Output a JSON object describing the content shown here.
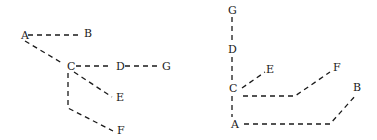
{
  "diagrams": [
    {
      "name": "left-tree",
      "nodes": [
        {
          "id": "A",
          "label": "A",
          "x": 21,
          "y": 39
        },
        {
          "id": "B",
          "label": "B",
          "x": 84,
          "y": 37
        },
        {
          "id": "C",
          "label": "C",
          "x": 67,
          "y": 70
        },
        {
          "id": "D",
          "label": "D",
          "x": 116,
          "y": 70
        },
        {
          "id": "G",
          "label": "G",
          "x": 162,
          "y": 70
        },
        {
          "id": "E",
          "label": "E",
          "x": 116,
          "y": 101
        },
        {
          "id": "F",
          "label": "F",
          "x": 117,
          "y": 134
        }
      ],
      "edges": [
        {
          "from": "A",
          "to": "B",
          "points": [
            [
              28,
              35
            ],
            [
              79,
              35
            ]
          ]
        },
        {
          "from": "A",
          "to": "C",
          "points": [
            [
              25,
              41
            ],
            [
              62,
              63
            ]
          ]
        },
        {
          "from": "C",
          "to": "D",
          "points": [
            [
              76,
              66
            ],
            [
              111,
              66
            ]
          ]
        },
        {
          "from": "D",
          "to": "G",
          "points": [
            [
              125,
              66
            ],
            [
              157,
              66
            ]
          ]
        },
        {
          "from": "C",
          "to": "E",
          "points": [
            [
              74,
              72
            ],
            [
              112,
              97
            ]
          ]
        },
        {
          "from": "C",
          "to": "F",
          "points": [
            [
              68,
              73
            ],
            [
              68,
              108
            ],
            [
              113,
              131
            ]
          ]
        }
      ]
    },
    {
      "name": "right-tree",
      "nodes": [
        {
          "id": "G",
          "label": "G",
          "x": 228,
          "y": 14
        },
        {
          "id": "D",
          "label": "D",
          "x": 228,
          "y": 53
        },
        {
          "id": "C",
          "label": "C",
          "x": 229,
          "y": 92
        },
        {
          "id": "A",
          "label": "A",
          "x": 231,
          "y": 128
        },
        {
          "id": "E",
          "label": "E",
          "x": 266,
          "y": 73
        },
        {
          "id": "F",
          "label": "F",
          "x": 333,
          "y": 71
        },
        {
          "id": "B",
          "label": "B",
          "x": 353,
          "y": 91
        }
      ],
      "edges": [
        {
          "from": "G",
          "to": "D",
          "points": [
            [
              232,
              17
            ],
            [
              232,
              43
            ]
          ]
        },
        {
          "from": "D",
          "to": "C",
          "points": [
            [
              232,
              57
            ],
            [
              232,
              82
            ]
          ]
        },
        {
          "from": "C",
          "to": "A",
          "points": [
            [
              232,
              96
            ],
            [
              232,
              117
            ]
          ]
        },
        {
          "from": "C",
          "to": "E",
          "points": [
            [
              242,
              88
            ],
            [
              265,
              72
            ]
          ]
        },
        {
          "from": "C",
          "to": "F",
          "points": [
            [
              243,
              96
            ],
            [
              295,
              96
            ],
            [
              330,
              72
            ]
          ]
        },
        {
          "from": "A",
          "to": "B",
          "points": [
            [
              244,
              124
            ],
            [
              330,
              124
            ],
            [
              356,
              95
            ]
          ]
        }
      ]
    }
  ]
}
